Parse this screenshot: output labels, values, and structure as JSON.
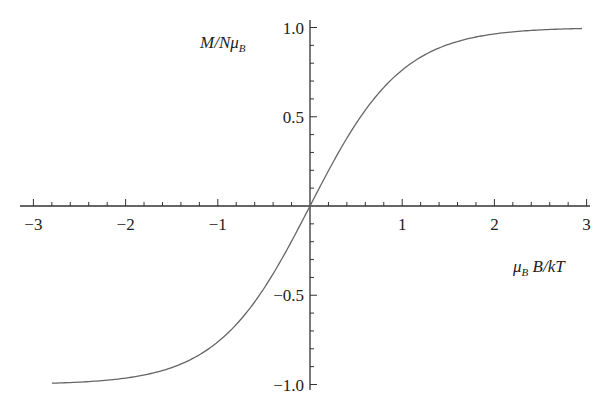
{
  "chart_data": {
    "type": "line",
    "title": "",
    "xlabel": "μB B/kT",
    "ylabel": "M/NμB",
    "xlim": [
      -3,
      3
    ],
    "ylim": [
      -1,
      1
    ],
    "grid": false,
    "legend": null,
    "axes_style": "crossing at origin",
    "x_ticks": [
      -3,
      -2,
      -1,
      1,
      2,
      3
    ],
    "x_tick_labels": [
      "−3",
      "−2",
      "−1",
      "1",
      "2",
      "3"
    ],
    "y_ticks": [
      -1.0,
      -0.5,
      0.5,
      1.0
    ],
    "y_tick_labels": [
      "−1.0",
      "−0.5",
      "0.5",
      "1.0"
    ],
    "minor_ticks_per_unit_x": 5,
    "minor_ticks_per_unit_y": 10,
    "series": [
      {
        "name": "M/NμB = tanh(μB B/kT)",
        "function": "tanh",
        "x": [
          -2.8,
          -2.5,
          -2.0,
          -1.5,
          -1.0,
          -0.5,
          0.0,
          0.5,
          1.0,
          1.5,
          2.0,
          2.5,
          2.95
        ],
        "y": [
          -0.993,
          -0.987,
          -0.964,
          -0.905,
          -0.762,
          -0.462,
          0.0,
          0.462,
          0.762,
          0.905,
          0.964,
          0.987,
          0.995
        ]
      }
    ],
    "color": "#666666"
  },
  "labels": {
    "y_axis": {
      "main": "M/Nμ",
      "sub": "B"
    },
    "x_axis": {
      "main_mu": "μ",
      "sub": "B",
      "rest": " B/kT"
    }
  }
}
